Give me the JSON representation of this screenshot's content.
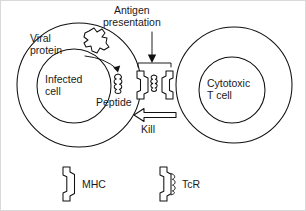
{
  "figure": {
    "ink_color": "#111111",
    "background_color": "#ffffff"
  },
  "labels": {
    "antigen_presentation_line1": "Antigen",
    "antigen_presentation_line2": "presentation",
    "viral_protein_line1": "Viral",
    "viral_protein_line2": "protein",
    "infected_cell_line1": "Infected",
    "infected_cell_line2": "cell",
    "peptide": "Peptide",
    "kill": "Kill",
    "cytotoxic_tcell_line1": "Cytotoxic",
    "cytotoxic_tcell_line2": "T cell"
  },
  "legend": {
    "items": [
      {
        "key": "mhc",
        "label": "MHC",
        "icon": "mhc-groove-icon"
      },
      {
        "key": "tcr",
        "label": "TcR",
        "icon": "tcr-squiggle-icon"
      }
    ]
  },
  "shapes": {
    "infected_cell": {
      "icon": "infected-cell-circle",
      "cx": 78,
      "cy": 84,
      "r": 62,
      "nucleus_cx": 73,
      "nucleus_cy": 85,
      "nucleus_r": 37
    },
    "tcell": {
      "icon": "cytotoxic-tcell-circle",
      "cx": 233,
      "cy": 84,
      "r": 58,
      "nucleus_cx": 231,
      "nucleus_cy": 89,
      "nucleus_r": 33
    },
    "viral_protein_blob": {
      "icon": "viral-protein-blob",
      "cx": 94,
      "cy": 41
    },
    "peptide_squiggle": {
      "icon": "peptide-squiggle",
      "cx": 117,
      "cy": 82
    },
    "mhc_complex": {
      "icon": "mhc-molecule",
      "cx": 146,
      "cy": 84
    },
    "tcr_complex": {
      "icon": "tcr-molecule",
      "cx": 164,
      "cy": 84
    },
    "antigen_arrow": {
      "icon": "down-arrow",
      "x": 151,
      "y1": 31,
      "y2": 64
    },
    "processing_arrow": {
      "icon": "curved-arrow",
      "from": [
        100,
        53
      ],
      "to": [
        119,
        70
      ]
    },
    "kill_arrow": {
      "icon": "left-block-arrow",
      "x1": 174,
      "x2": 134,
      "y": 114
    }
  }
}
